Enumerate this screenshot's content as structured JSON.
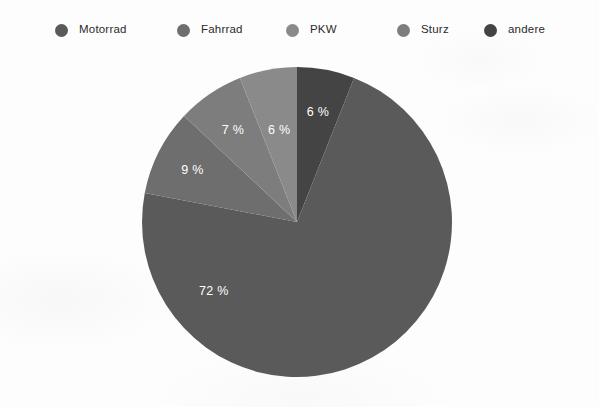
{
  "chart_data": {
    "type": "pie",
    "title": "",
    "categories": [
      "Motorrad",
      "Fahrrad",
      "PKW",
      "Sturz",
      "andere"
    ],
    "values": [
      72,
      9,
      7,
      6,
      6
    ],
    "value_labels": [
      "72 %",
      "9 %",
      "7 %",
      "6 %",
      "6 %"
    ],
    "colors": [
      "#5a5a5a",
      "#6e6e6e",
      "#8a8a8a",
      "#7d7d7d",
      "#444444"
    ],
    "unit": "%",
    "legend_position": "top",
    "grid": false,
    "start_angle_deg": 0,
    "direction": "clockwise",
    "slices": [
      {
        "label": "andere",
        "value": 6,
        "display": "6 %",
        "color": "#444444",
        "start_deg": 0,
        "end_deg": 21.6,
        "label_angle_deg": 10.8,
        "label_radius": 0.72
      },
      {
        "label": "Motorrad",
        "value": 72,
        "display": "72 %",
        "color": "#5a5a5a",
        "start_deg": 21.6,
        "end_deg": 280.8,
        "label_angle_deg": 230.0,
        "label_radius": 0.7
      },
      {
        "label": "Fahrrad",
        "value": 9,
        "display": "9 %",
        "color": "#6e6e6e",
        "start_deg": 280.8,
        "end_deg": 313.2,
        "label_angle_deg": 296.0,
        "label_radius": 0.75
      },
      {
        "label": "Sturz",
        "value": 7,
        "display": "7 %",
        "color": "#7d7d7d",
        "start_deg": 313.2,
        "end_deg": 338.4,
        "label_angle_deg": 325.0,
        "label_radius": 0.72
      },
      {
        "label": "PKW",
        "value": 7,
        "display": "6 %",
        "color": "#8a8a8a",
        "start_deg": 338.4,
        "end_deg": 360.0,
        "label_angle_deg": 349.0,
        "label_radius": 0.6
      }
    ]
  },
  "legend": {
    "items": [
      {
        "label": "Motorrad",
        "color": "#5a5a5a",
        "x": 55
      },
      {
        "label": "Fahrrad",
        "color": "#6e6e6e",
        "x": 177
      },
      {
        "label": "PKW",
        "color": "#8a8a8a",
        "x": 286
      },
      {
        "label": "Sturz",
        "color": "#7d7d7d",
        "x": 397
      },
      {
        "label": "andere",
        "color": "#444444",
        "x": 484
      }
    ]
  },
  "pie_geometry": {
    "center_x": 156,
    "center_y": 156,
    "radius": 155
  }
}
